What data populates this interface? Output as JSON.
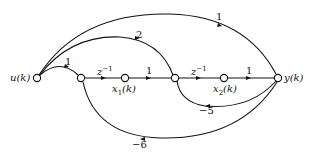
{
  "diagram": {
    "type": "signal-flow-graph",
    "nodes": [
      {
        "id": "u",
        "label": "u(k)"
      },
      {
        "id": "n1",
        "label": ""
      },
      {
        "id": "x1",
        "label": "x1(k)"
      },
      {
        "id": "n2",
        "label": ""
      },
      {
        "id": "x2",
        "label": "x2(k)"
      },
      {
        "id": "y",
        "label": "y(k)"
      }
    ],
    "edges": [
      {
        "from": "u",
        "to": "n1",
        "gain": "1"
      },
      {
        "from": "n1",
        "to": "x1",
        "gain": "z^-1"
      },
      {
        "from": "x1",
        "to": "n2",
        "gain": "1"
      },
      {
        "from": "n2",
        "to": "x2",
        "gain": "z^-1"
      },
      {
        "from": "x2",
        "to": "y",
        "gain": "1"
      },
      {
        "from": "u",
        "to": "y",
        "gain": "1"
      },
      {
        "from": "u",
        "to": "n2",
        "gain": "2"
      },
      {
        "from": "y",
        "to": "n2",
        "gain": "-5"
      },
      {
        "from": "y",
        "to": "n1",
        "gain": "-6"
      }
    ]
  },
  "labels": {
    "u": "u(k)",
    "y": "y(k)",
    "x1_main": "x",
    "x1_sub": "1",
    "x1_arg": "(k)",
    "x2_main": "x",
    "x2_sub": "2",
    "x2_arg": "(k)",
    "z_base": "z",
    "z_exp": "−1",
    "gain_top": "1",
    "gain_2": "2",
    "gain_u_n1": "1",
    "gain_x1_n2": "1",
    "gain_x2_y": "1",
    "gain_m5": "−5",
    "gain_m6": "−6"
  }
}
